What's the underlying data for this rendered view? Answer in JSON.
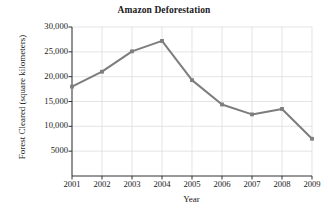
{
  "chart_data": {
    "type": "line",
    "title": "Amazon Deforestation",
    "xlabel": "Year",
    "ylabel": "Forest Cleared (square kilometers)",
    "categories": [
      2001,
      2002,
      2003,
      2004,
      2005,
      2006,
      2007,
      2008,
      2009
    ],
    "x_tick_labels": [
      "2001",
      "2002",
      "2003",
      "2004",
      "2005",
      "2006",
      "2007",
      "2008",
      "2009"
    ],
    "values": [
      18000,
      21000,
      25100,
      27200,
      19300,
      14400,
      12400,
      13500,
      7500
    ],
    "y_tick_labels": [
      "5000",
      "10,000",
      "15,000",
      "20,000",
      "25,000",
      "30,000"
    ],
    "y_tick_values": [
      5000,
      10000,
      15000,
      20000,
      25000,
      30000
    ],
    "ylim": [
      0,
      30000
    ],
    "xlim": [
      2001,
      2009
    ],
    "grid": true,
    "legend": "none",
    "series_color": "#7d7d7d",
    "grid_color": "#d9d9d9",
    "axis_color": "#333333"
  }
}
